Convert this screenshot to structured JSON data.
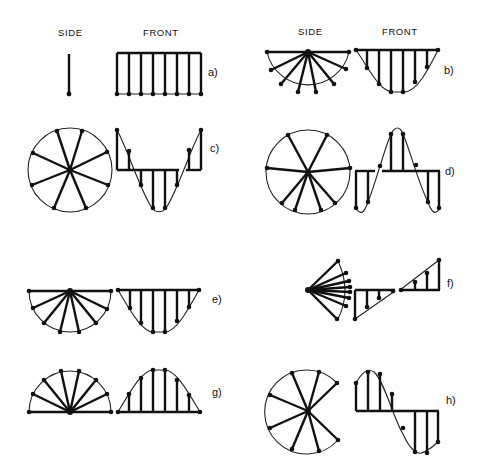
{
  "headers": {
    "left_side": "SIDE",
    "left_front": "FRONT",
    "right_side": "SIDE",
    "right_front": "FRONT"
  },
  "panels": [
    {
      "id": "a",
      "label": "a)",
      "side_view": "vertical line (edge-on)",
      "front_view": "uniform amplitude, 8 vectors"
    },
    {
      "id": "b",
      "label": "b)",
      "side_view": "lower semicircle fan, 8 vectors",
      "front_view": "half-sine below axis, 8 vectors"
    },
    {
      "id": "c",
      "label": "c)",
      "side_view": "full circle, 8 vectors",
      "front_view": "cosine, 8 vectors"
    },
    {
      "id": "d",
      "label": "d)",
      "side_view": "full circle, 8 vectors",
      "front_view": "sine, 8 vectors"
    },
    {
      "id": "e",
      "label": "e)",
      "side_view": "lower semicircle fan, 8 vectors",
      "front_view": "half-sine below axis, 8 vectors"
    },
    {
      "id": "f",
      "label": "f)",
      "side_view": "narrow fan, 10 vectors",
      "front_view": "linear ramp, 8 vectors"
    },
    {
      "id": "g",
      "label": "g)",
      "side_view": "upper semicircle fan, 8 vectors",
      "front_view": "half-sine above axis, 8 vectors"
    },
    {
      "id": "h",
      "label": "h)",
      "side_view": "open circle arc, 8 vectors",
      "front_view": "sine, 8 vectors"
    }
  ]
}
